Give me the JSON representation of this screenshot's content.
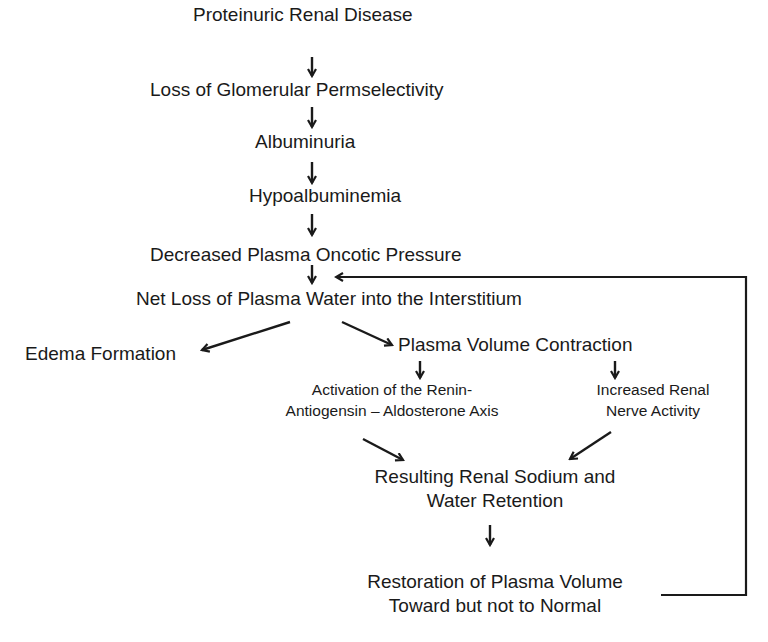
{
  "diagram": {
    "nodes": {
      "proteinuric": "Proteinuric Renal Disease",
      "loss_perm": "Loss of Glomerular Permselectivity",
      "albuminuria": "Albuminuria",
      "hypoalb": "Hypoalbuminemia",
      "decreased_onc": "Decreased Plasma Oncotic Pressure",
      "net_loss": "Net Loss of Plasma Water into the Interstitium",
      "edema": "Edema Formation",
      "plasma_contraction": "Plasma Volume Contraction",
      "raas_line1": "Activation of the Renin-",
      "raas_line2": "Antiogensin – Aldosterone  Axis",
      "nerve_line1": "Increased Renal",
      "nerve_line2": "Nerve Activity",
      "retention_line1": "Resulting Renal Sodium and",
      "retention_line2": "Water Retention",
      "restoration_line1": "Restoration of Plasma Volume",
      "restoration_line2": "Toward but not to Normal"
    },
    "edges": [
      [
        "proteinuric",
        "loss_perm"
      ],
      [
        "loss_perm",
        "albuminuria"
      ],
      [
        "albuminuria",
        "hypoalb"
      ],
      [
        "hypoalb",
        "decreased_onc"
      ],
      [
        "decreased_onc",
        "net_loss"
      ],
      [
        "net_loss",
        "edema"
      ],
      [
        "net_loss",
        "plasma_contraction"
      ],
      [
        "plasma_contraction",
        "raas"
      ],
      [
        "plasma_contraction",
        "nerve"
      ],
      [
        "raas",
        "retention"
      ],
      [
        "nerve",
        "retention"
      ],
      [
        "retention",
        "restoration"
      ],
      [
        "restoration",
        "net_loss"
      ]
    ],
    "colors": {
      "ink": "#1a1a1a",
      "background": "#ffffff"
    }
  }
}
